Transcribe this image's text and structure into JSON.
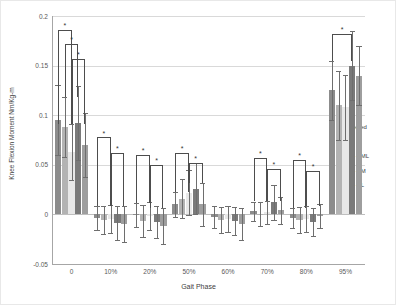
{
  "chart_data": {
    "type": "bar",
    "title": "",
    "xlabel": "Gait Phase",
    "ylabel": "Knee Flexion Moment Nm/Kg-m",
    "categories": [
      "0",
      "10%",
      "20%",
      "50%",
      "60%",
      "70%",
      "80%",
      "95%"
    ],
    "ylim": [
      -0.05,
      0.2
    ],
    "yticks": [
      -0.05,
      0,
      0.05,
      0.1,
      0.15,
      0.2
    ],
    "ytick_labels": [
      "-0.05",
      "0",
      "0.05",
      "0.1",
      "0.15",
      "0.2"
    ],
    "grid": true,
    "legend_position": "right",
    "error_bar_type": "sd",
    "series": [
      {
        "name": "Unaffected",
        "color": "#8c8c8c",
        "values": [
          0.095,
          -0.004,
          -0.001,
          0.01,
          -0.003,
          0.003,
          -0.004,
          0.125
        ],
        "errors": [
          0.035,
          0.012,
          0.012,
          0.013,
          0.011,
          0.01,
          0.01,
          0.03
        ]
      },
      {
        "name": "ACLD",
        "color": "#b3b3b3",
        "values": [
          0.088,
          -0.006,
          -0.007,
          0.016,
          -0.006,
          0.0,
          -0.006,
          0.11
        ],
        "errors": [
          0.03,
          0.014,
          0.016,
          0.02,
          0.013,
          0.012,
          0.013,
          0.035
        ]
      },
      {
        "name": "ACLD + ML",
        "color": "#e8e8e8",
        "values": [
          0.063,
          -0.005,
          -0.002,
          0.022,
          -0.005,
          0.002,
          -0.005,
          0.108
        ],
        "errors": [
          0.028,
          0.014,
          0.014,
          0.023,
          0.013,
          0.012,
          0.013,
          0.033
        ]
      },
      {
        "name": "ACLD + M",
        "color": "#7a7a7a",
        "values": [
          0.092,
          -0.009,
          -0.008,
          0.026,
          -0.007,
          0.012,
          -0.008,
          0.15
        ],
        "errors": [
          0.037,
          0.017,
          0.016,
          0.026,
          0.014,
          0.018,
          0.014,
          0.035
        ]
      },
      {
        "name": "ACLD + L",
        "color": "#9e9e9e",
        "values": [
          0.07,
          -0.01,
          -0.012,
          0.01,
          -0.01,
          0.004,
          -0.002,
          0.14
        ],
        "errors": [
          0.032,
          0.018,
          0.018,
          0.022,
          0.016,
          0.014,
          0.012,
          0.03
        ]
      }
    ],
    "significance_brackets": [
      {
        "group": "0",
        "from": 0,
        "to": 2,
        "top": 0.186,
        "label": "*"
      },
      {
        "group": "0",
        "from": 1,
        "to": 3,
        "top": 0.172,
        "label": "*"
      },
      {
        "group": "0",
        "from": 2,
        "to": 4,
        "top": 0.157,
        "label": "*"
      },
      {
        "group": "10%",
        "from": 0,
        "to": 2,
        "top": 0.078,
        "label": "*"
      },
      {
        "group": "10%",
        "from": 2,
        "to": 4,
        "top": 0.062,
        "label": "*"
      },
      {
        "group": "20%",
        "from": 0,
        "to": 2,
        "top": 0.06,
        "label": "*"
      },
      {
        "group": "20%",
        "from": 2,
        "to": 4,
        "top": 0.05,
        "label": "*"
      },
      {
        "group": "50%",
        "from": 0,
        "to": 2,
        "top": 0.062,
        "label": "*"
      },
      {
        "group": "50%",
        "from": 2,
        "to": 4,
        "top": 0.052,
        "label": "*"
      },
      {
        "group": "70%",
        "from": 0,
        "to": 2,
        "top": 0.057,
        "label": "*"
      },
      {
        "group": "70%",
        "from": 2,
        "to": 4,
        "top": 0.046,
        "label": "*"
      },
      {
        "group": "80%",
        "from": 0,
        "to": 2,
        "top": 0.055,
        "label": "*"
      },
      {
        "group": "80%",
        "from": 2,
        "to": 4,
        "top": 0.044,
        "label": "*"
      },
      {
        "group": "95%",
        "from": 0,
        "to": 3,
        "top": 0.182,
        "label": "*"
      }
    ]
  }
}
